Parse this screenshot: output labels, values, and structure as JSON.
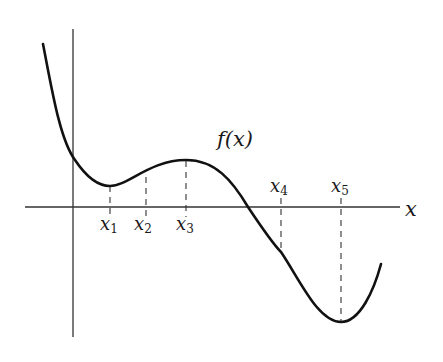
{
  "figure": {
    "function_label": "f(x)",
    "x_axis_label": "x",
    "colors": {
      "curve": "#111111",
      "axes": "#333333",
      "dashed_guides": "#333333",
      "background": "#ffffff"
    },
    "points": [
      {
        "name": "x",
        "sub": "1",
        "role": "local minimum",
        "label_position": "below"
      },
      {
        "name": "x",
        "sub": "2",
        "role": "point on rising segment",
        "label_position": "below"
      },
      {
        "name": "x",
        "sub": "3",
        "role": "local maximum",
        "label_position": "below"
      },
      {
        "name": "x",
        "sub": "4",
        "role": "point on falling segment (below axis)",
        "label_position": "above"
      },
      {
        "name": "x",
        "sub": "5",
        "role": "local minimum (below axis)",
        "label_position": "above"
      }
    ]
  }
}
